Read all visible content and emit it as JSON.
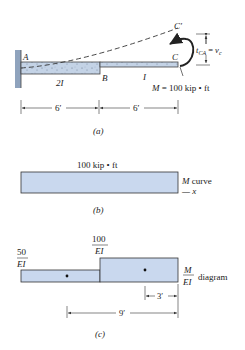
{
  "figure_a": {
    "point_a": "A",
    "point_b": "B",
    "point_c": "C",
    "point_c_prime": "C′",
    "section_left_inertia": "2I",
    "section_right_inertia": "I",
    "moment_label": "M = 100 kip • ft",
    "deflection_label": "t",
    "deflection_sub": "CA",
    "deflection_eq": " = v",
    "deflection_eq_sub": "c",
    "dim_left": "6′",
    "dim_right": "6′",
    "caption": "(a)"
  },
  "figure_b": {
    "value_label": "100 kip • ft",
    "curve_label": "M curve",
    "axis_label": "— x",
    "caption": "(b)"
  },
  "figure_c": {
    "left_num": "50",
    "left_den": "EI",
    "right_num": "100",
    "right_den": "EI",
    "diag_num": "M",
    "diag_den": "EI",
    "diag_word": "diagram",
    "dim_short": "3′",
    "dim_long": "9′",
    "caption": "(c)"
  },
  "colors": {
    "fill": "#c9d8ee",
    "stroke": "#333333",
    "beam": "#c4d3e6"
  }
}
